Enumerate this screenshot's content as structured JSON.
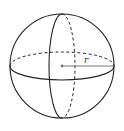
{
  "diagram": {
    "type": "sphere",
    "radius_label": "r",
    "colors": {
      "stroke": "#222222",
      "background": "#ffffff",
      "radius_line": "#555555",
      "center_dot": "#777777"
    }
  }
}
